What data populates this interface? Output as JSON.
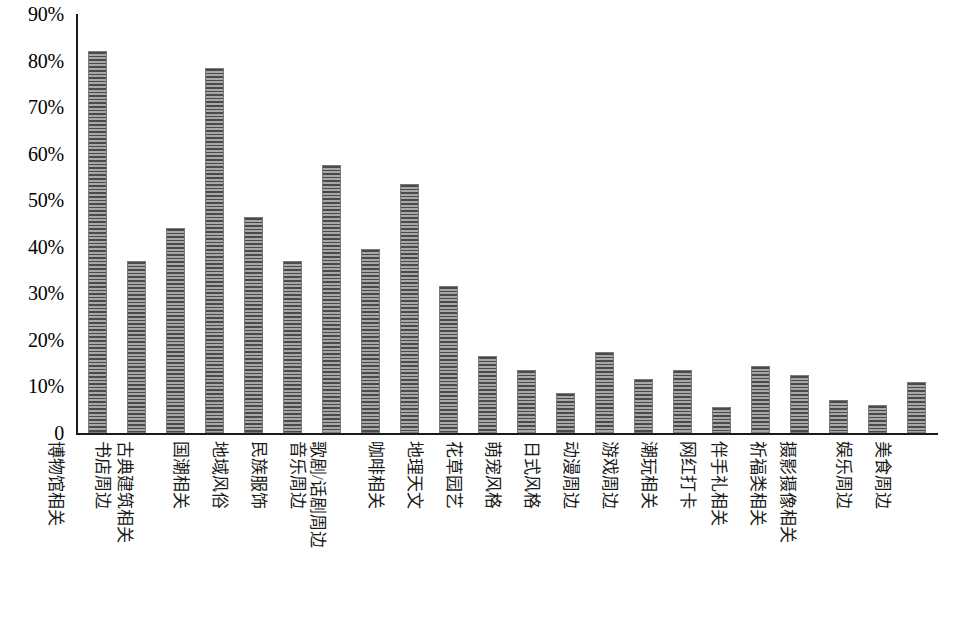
{
  "chart_data": {
    "type": "bar",
    "title": "",
    "subtitle": "",
    "xlabel": "",
    "ylabel": "",
    "ylim": [
      0,
      90
    ],
    "grid": false,
    "legend": null,
    "y_tick_labels": [
      "90%",
      "80%",
      "70%",
      "60%",
      "50%",
      "40%",
      "30%",
      "20%",
      "10%",
      "0"
    ],
    "y_tick_values": [
      90,
      80,
      70,
      60,
      50,
      40,
      30,
      20,
      10,
      0
    ],
    "categories": [
      "博物馆相关",
      "书店周边",
      "古典建筑相关",
      "国潮相关",
      "地域风俗",
      "民族服饰",
      "音乐周边",
      "歌剧/话剧周边",
      "咖啡相关",
      "地理天文",
      "花草园艺",
      "萌宠风格",
      "日式风格",
      "动漫周边",
      "游戏周边",
      "潮玩相关",
      "网红打卡",
      "伴手礼相关",
      "祈福类相关",
      "摄影摄像相关",
      "娱乐周边",
      "美食周边"
    ],
    "values": [
      82.0,
      37.0,
      44.0,
      78.5,
      46.5,
      37.0,
      57.5,
      39.5,
      53.5,
      31.5,
      16.5,
      13.5,
      8.5,
      17.5,
      11.5,
      13.5,
      5.5,
      14.5,
      12.5,
      7.0,
      6.0,
      11.0
    ],
    "bar_color": "#8e8e8e",
    "bar_hatch": "horizontal-lines",
    "axis_color": "#1a1a1a"
  }
}
